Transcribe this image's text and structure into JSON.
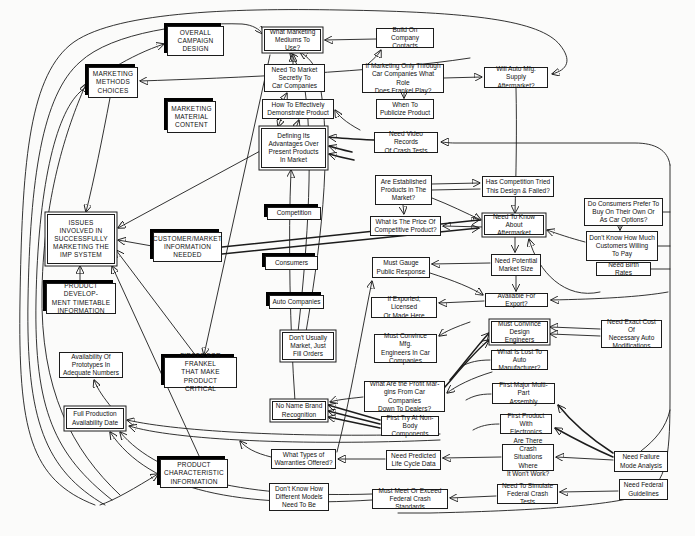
{
  "diagram": {
    "colors": {
      "line": "#1c1c1c",
      "box_background": "#ffffff",
      "page_background": "#fbfbfa",
      "shadow": "#000000"
    },
    "nodes": [
      {
        "id": "overall-campaign-design",
        "label": "OVERALL\nCAMPAIGN\nDESIGN"
      },
      {
        "id": "what-marketing-mediums",
        "label": "What Marketing\nMediums To Use?"
      },
      {
        "id": "build-on-company-contacts",
        "label": "Build On\nCompany Contacts"
      },
      {
        "id": "will-auto-mfg-supply",
        "label": "Will Auto Mfg. Supply\nAftermarket?"
      },
      {
        "id": "marketing-methods-choices",
        "label": "MARKETING\nMETHODS\nCHOICES"
      },
      {
        "id": "need-to-market-secretly",
        "label": "Need To Market\nSecretly To\nCar Companies"
      },
      {
        "id": "if-marketing-only-through",
        "label": "If Marketing Only Through\nCar Companies What Role\nDoes Frankel Play?"
      },
      {
        "id": "marketing-material-content",
        "label": "MARKETING\nMATERIAL\nCONTENT"
      },
      {
        "id": "how-to-effectively-demonstrate",
        "label": "How To Effectively\nDemonstrate Product"
      },
      {
        "id": "when-to-publicize",
        "label": "When To\nPublicize Product"
      },
      {
        "id": "defining-its-advantages",
        "label": "Defining Its\nAdvantages Over\nPresent Products\nIn Market"
      },
      {
        "id": "need-video-records",
        "label": "Need Video Records\nOf Crash Tests"
      },
      {
        "id": "are-established-products",
        "label": "Are Established\nProducts in The\nMarket?"
      },
      {
        "id": "has-competition-tried",
        "label": "Has Competition Tried\nThis Design & Failed?"
      },
      {
        "id": "what-is-the-price",
        "label": "What is The Price Of\nCompetitive Product?"
      },
      {
        "id": "do-consumers-prefer",
        "label": "Do Consumers Prefer To\nBuy On Their Own Or\nAs Car Options?"
      },
      {
        "id": "need-to-know-aftermarket",
        "label": "Need To Know About\nAftermarket"
      },
      {
        "id": "dont-know-how-much",
        "label": "Don't Know How Much\nCustomers Willing\nTo Pay"
      },
      {
        "id": "issues-involved",
        "label": "ISSUES\nINVOLVED IN\nSUCCESSFULLY\nMARKETING THE\nIMP SYSTEM"
      },
      {
        "id": "customer-market-information",
        "label": "CUSTOMER/MARKET\nINFORMATION\nNEEDED"
      },
      {
        "id": "competition",
        "label": "Competition"
      },
      {
        "id": "need-birth-rates",
        "label": "Need Birth Rates"
      },
      {
        "id": "need-potential-market-size",
        "label": "Need Potential\nMarket Size"
      },
      {
        "id": "consumers",
        "label": "Consumers"
      },
      {
        "id": "must-gauge-public-response",
        "label": "Must Gauge\nPublic Response"
      },
      {
        "id": "product-development-timetable",
        "label": "PRODUCT DEVELOP-\nMENT TIMETABLE\nINFORMATION"
      },
      {
        "id": "available-for-export",
        "label": "Available For Export?"
      },
      {
        "id": "auto-companies",
        "label": "Auto Companies"
      },
      {
        "id": "if-exported-licensed",
        "label": "If Exported, Licensed\nOr Made Here"
      },
      {
        "id": "must-convince-design",
        "label": "Must Convince\nDesign Engineers"
      },
      {
        "id": "need-exact-cost",
        "label": "Need Exact Cost Of\nNecessary Auto\nModifications"
      },
      {
        "id": "dont-usually-market",
        "label": "Don't Usually\nMarket, Just\nFill Orders"
      },
      {
        "id": "must-convince-mfg",
        "label": "Must Convince Mfg.\nEngineers In Car\nCompanies"
      },
      {
        "id": "what-is-lost",
        "label": "What Is Lost To\nAuto Manufacturer?"
      },
      {
        "id": "availability-of-prototypes",
        "label": "Availability Of\nPrototypes In\nAdequate Numbers"
      },
      {
        "id": "firsts-for-frankel",
        "label": "FIRSTS FOR FRANKEL\nTHAT MAKE PRODUCT\nCRITICAL"
      },
      {
        "id": "what-are-profit-margins",
        "label": "What Are the Profit Mar-\ngins From Car Companies\nDown To Dealers?"
      },
      {
        "id": "first-major-multipart",
        "label": "First Major Multi-Part\nAssembly"
      },
      {
        "id": "no-name-brand",
        "label": "No Name Brand\nRecognition"
      },
      {
        "id": "first-try-nonbody",
        "label": "First Try At Non-\nBody Components"
      },
      {
        "id": "full-production-availability",
        "label": "Full Production\nAvailability Date"
      },
      {
        "id": "first-product-electronics",
        "label": "First Product\nWith Electronics"
      },
      {
        "id": "are-there-crash",
        "label": "Are There Crash\nSituations Where\nIt Won't Work?"
      },
      {
        "id": "need-failure-mode",
        "label": "Need Failure\nMode Analysis"
      },
      {
        "id": "what-types-warranties",
        "label": "What Types of\nWarranties Offered?"
      },
      {
        "id": "need-predicted-life-cycle",
        "label": "Need Predicted\nLife Cycle Data"
      },
      {
        "id": "product-characteristic",
        "label": "PRODUCT\nCHARACTERISTIC\nINFORMATION"
      },
      {
        "id": "dont-know-how-different",
        "label": "Don't Know How\nDifferent Models\nNeed To Be"
      },
      {
        "id": "must-meet-or-exceed",
        "label": "Must Meet Or Exceed\nFederal Crash Standards"
      },
      {
        "id": "need-to-simulate",
        "label": "Need To Simulate\nFederal Crash Tests"
      },
      {
        "id": "need-federal-guidelines",
        "label": "Need Federal\nGuidelines"
      }
    ]
  }
}
